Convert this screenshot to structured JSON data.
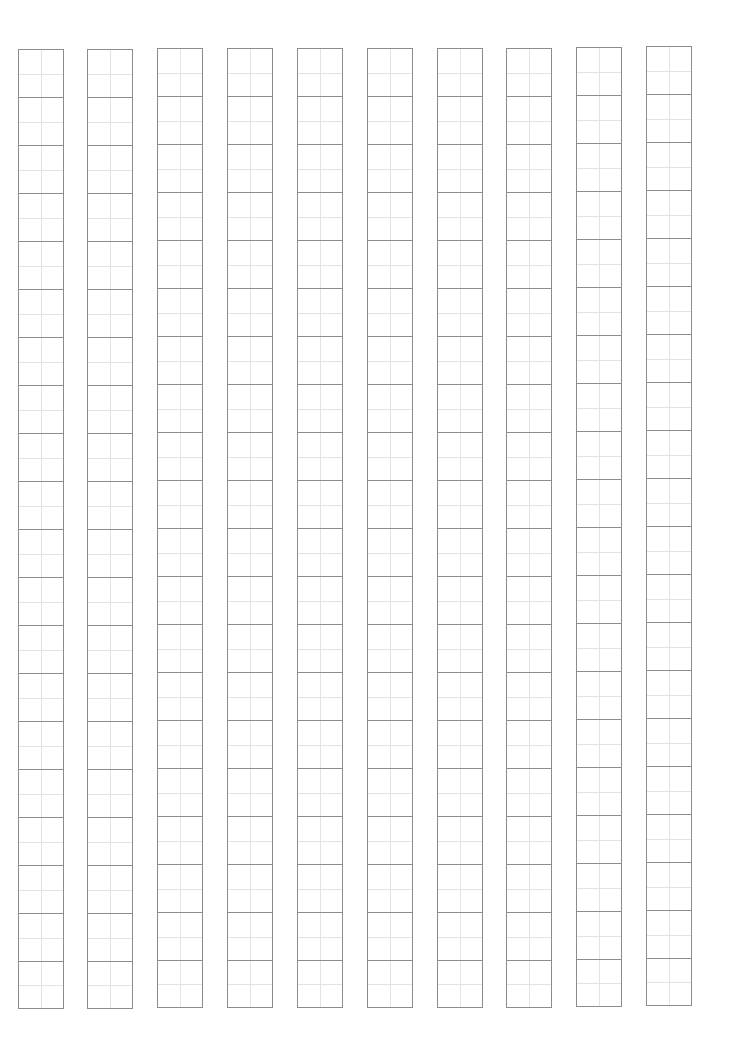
{
  "page": {
    "type": "tian-zi-ge writing practice grid",
    "background": "#ffffff",
    "border_color": "#8c8c8c",
    "guide_color": "#e3e3e3"
  },
  "grid": {
    "columns": 10,
    "rows_per_column": 20,
    "cell_width": 46,
    "cell_height": 48,
    "column_x": [
      18,
      87,
      157,
      227,
      297,
      367,
      437,
      506,
      576,
      646
    ],
    "column_top": [
      49,
      49,
      48,
      48,
      48,
      48,
      48,
      48,
      47,
      46
    ]
  }
}
